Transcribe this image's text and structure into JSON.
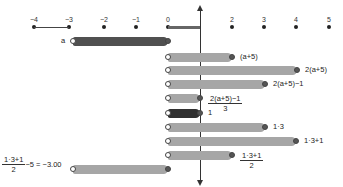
{
  "number_line": {
    "ticks": [
      {
        "label": "−4",
        "x": 34
      },
      {
        "label": "−3",
        "x": 69
      },
      {
        "label": "−2",
        "x": 104
      },
      {
        "label": "−1",
        "x": 136
      },
      {
        "label": "0",
        "x": 168
      },
      {
        "label": "2",
        "x": 232
      },
      {
        "label": "3",
        "x": 264
      },
      {
        "label": "4",
        "x": 296
      },
      {
        "label": "5",
        "x": 329
      }
    ],
    "y": 27,
    "label_y": 16
  },
  "vertical_axis": {
    "x": 200,
    "top": 8,
    "bottom": 183
  },
  "variable_label": "a",
  "rows": [
    {
      "id": "a",
      "label": "a",
      "x1": 73,
      "x2": 168,
      "y": 41,
      "style": "dark",
      "label_side": "left"
    },
    {
      "id": "a-plus-5",
      "label": "(a+5)",
      "x1": 168,
      "x2": 232,
      "y": 57,
      "style": "gray"
    },
    {
      "id": "two-a-plus-5",
      "label": "2(a+5)",
      "x1": 168,
      "x2": 297,
      "y": 70,
      "style": "gray"
    },
    {
      "id": "two-a-plus-5-minus-1",
      "label": "2(a+5)−1",
      "x1": 168,
      "x2": 265,
      "y": 84,
      "style": "gray"
    },
    {
      "id": "div-3",
      "label_num": "2(a+5)−1",
      "label_den": "3",
      "x1": 168,
      "x2": 200,
      "y": 98,
      "style": "gray",
      "fraction": true
    },
    {
      "id": "one",
      "label": "1",
      "x1": 168,
      "x2": 200,
      "y": 113,
      "style": "darker"
    },
    {
      "id": "one-times-3",
      "label": "1·3",
      "x1": 168,
      "x2": 265,
      "y": 127,
      "style": "gray"
    },
    {
      "id": "one-times-3-plus-1",
      "label": "1·3+1",
      "x1": 168,
      "x2": 296,
      "y": 141,
      "style": "gray"
    },
    {
      "id": "half",
      "label_num": "1·3+1",
      "label_den": "2",
      "x1": 168,
      "x2": 232,
      "y": 155,
      "style": "gray",
      "fraction": true
    },
    {
      "id": "result",
      "label_num": "1·3+1",
      "label_den": "2",
      "label_suffix": "−5 = −3.00",
      "x1": 73,
      "x2": 168,
      "y": 169,
      "style": "gray",
      "fraction": true,
      "label_side": "left"
    }
  ]
}
